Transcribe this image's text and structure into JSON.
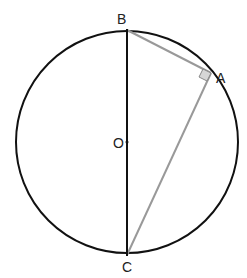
{
  "diagram": {
    "type": "geometry",
    "circle": {
      "cx": 127,
      "cy": 142,
      "r": 111,
      "stroke": "#111111"
    },
    "points": {
      "B": {
        "label": "B",
        "x": 127,
        "y": 29
      },
      "A": {
        "label": "A",
        "x": 211,
        "y": 73
      },
      "O": {
        "label": "O",
        "x": 127,
        "y": 142
      },
      "C": {
        "label": "C",
        "x": 127,
        "y": 255
      }
    },
    "segments": [
      {
        "from": "B",
        "to": "C",
        "role": "diameter",
        "color": "#111111"
      },
      {
        "from": "B",
        "to": "A",
        "role": "chord",
        "color": "#999999"
      },
      {
        "from": "A",
        "to": "C",
        "role": "chord",
        "color": "#999999"
      }
    ],
    "right_angle_marker": {
      "at": "A",
      "fill": "#d6d6d6",
      "stroke": "#888888"
    }
  }
}
